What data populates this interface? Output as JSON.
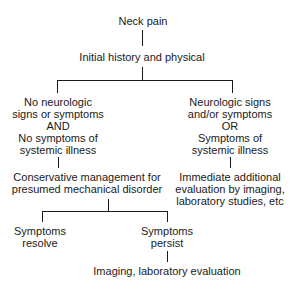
{
  "flowchart": {
    "root": "Neck pain",
    "step1": "Initial history and physical",
    "branch_left": {
      "lines": [
        "No neurologic",
        "signs or symptoms",
        "AND",
        "No symptoms of",
        "systemic illness"
      ]
    },
    "branch_right": {
      "lines": [
        "Neurologic signs",
        "and/or symptoms",
        "OR",
        "Symptoms of",
        "systemic illness"
      ]
    },
    "left_action": {
      "lines": [
        "Conservative management for",
        "presumed mechanical disorder"
      ]
    },
    "right_action": {
      "lines": [
        "Immediate additional",
        "evaluation by imaging,",
        "laboratory studies, etc"
      ]
    },
    "outcome_resolve": {
      "lines": [
        "Symptoms",
        "resolve"
      ]
    },
    "outcome_persist": {
      "lines": [
        "Symptoms",
        "persist"
      ]
    },
    "final": "Imaging, laboratory evaluation"
  }
}
